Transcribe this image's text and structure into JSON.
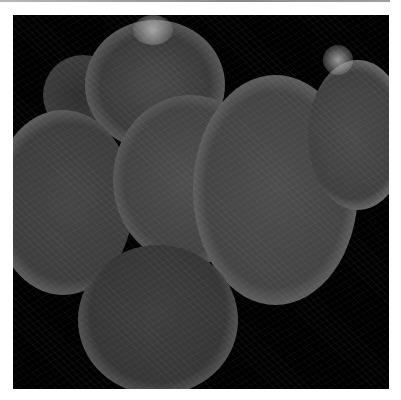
{
  "image": {
    "description": "Grayscale fluorescence microscopy image of a cluster of rounded cell aggregates with filamentous internal texture on a black background",
    "background_color": "#000000",
    "frame_color": "#ffffff"
  }
}
